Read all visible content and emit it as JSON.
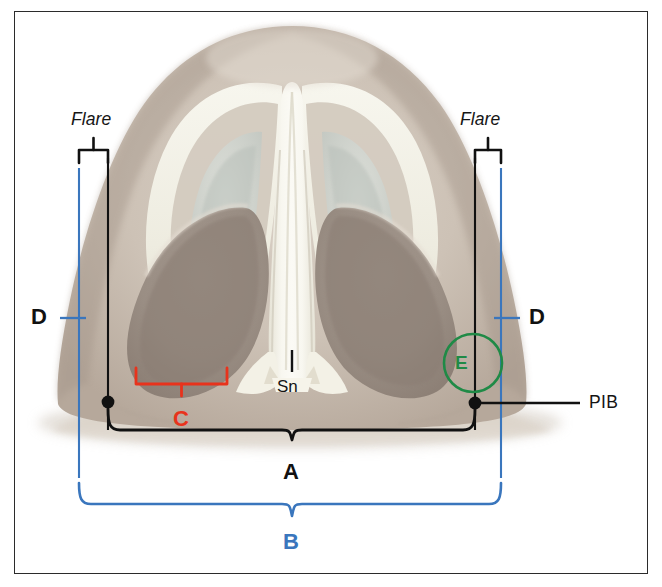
{
  "figure": {
    "type": "anatomical-diagram",
    "frame_color": "#2b2b2b",
    "background_color": "#ffffff"
  },
  "palette": {
    "black": "#111111",
    "red": "#e8331c",
    "blue": "#3a76bd",
    "green": "#1f8a46",
    "skin_light": "#d8cfc4",
    "skin_mid": "#c3b6a9",
    "skin_dark": "#9d9086",
    "cartilage": "#f4f2e8"
  },
  "labels": {
    "flare_left": "Flare",
    "flare_right": "Flare",
    "measure_a": "A",
    "measure_b": "B",
    "measure_c": "C",
    "measure_d_left": "D",
    "measure_d_right": "D",
    "region_e": "E",
    "subnasale": "Sn",
    "pib": "PIB"
  },
  "annotations": [
    {
      "key": "flare_left",
      "text": "Flare",
      "color": "#161616",
      "style": "italic",
      "role": "bracket-label"
    },
    {
      "key": "flare_right",
      "text": "Flare",
      "color": "#161616",
      "style": "italic",
      "role": "bracket-label"
    },
    {
      "key": "measure_d_left",
      "text": "D",
      "color": "#111111",
      "style": "bold",
      "role": "tick-label"
    },
    {
      "key": "measure_d_right",
      "text": "D",
      "color": "#111111",
      "style": "bold",
      "role": "tick-label"
    },
    {
      "key": "measure_c",
      "text": "C",
      "color": "#e8331c",
      "style": "bold",
      "role": "brace-label"
    },
    {
      "key": "region_e",
      "text": "E",
      "color": "#1f8a46",
      "style": "bold",
      "role": "circle-callout"
    },
    {
      "key": "subnasale",
      "text": "Sn",
      "color": "#141414",
      "style": "regular",
      "role": "point-label"
    },
    {
      "key": "pib",
      "text": "PIB",
      "color": "#141414",
      "style": "regular",
      "role": "leader-label"
    },
    {
      "key": "measure_a",
      "text": "A",
      "color": "#111111",
      "style": "bold",
      "role": "brace-label"
    },
    {
      "key": "measure_b",
      "text": "B",
      "color": "#3a76bd",
      "style": "bold",
      "role": "brace-label"
    }
  ]
}
